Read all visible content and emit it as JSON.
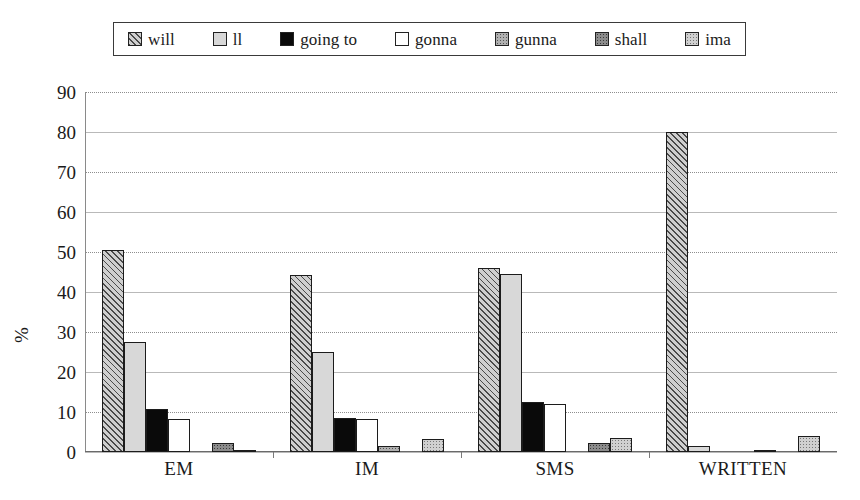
{
  "chart_data": {
    "type": "bar",
    "title": "",
    "subtitle": "",
    "xlabel": "",
    "ylabel": "%",
    "ylim": [
      0,
      90
    ],
    "ytick_step": 10,
    "yticks": [
      90,
      80,
      70,
      60,
      50,
      40,
      30,
      20,
      10,
      0
    ],
    "grid": true,
    "grid_axis": "y",
    "legend_position": "top",
    "categories": [
      "EM",
      "IM",
      "SMS",
      "WRITTEN"
    ],
    "series": [
      {
        "name": "will",
        "values": [
          50.5,
          44.2,
          46.1,
          80.0
        ]
      },
      {
        "name": "ll",
        "values": [
          27.6,
          24.9,
          44.4,
          1.5
        ]
      },
      {
        "name": "going to",
        "values": [
          10.8,
          8.5,
          12.6,
          0.0
        ]
      },
      {
        "name": "gonna",
        "values": [
          8.3,
          8.2,
          12.0,
          0.0
        ]
      },
      {
        "name": "gunna",
        "values": [
          0.0,
          1.5,
          0.0,
          0.4
        ]
      },
      {
        "name": "shall",
        "values": [
          2.2,
          0.0,
          2.3,
          0.0
        ]
      },
      {
        "name": "ima",
        "values": [
          0.6,
          3.3,
          3.4,
          4.0
        ]
      }
    ]
  },
  "legend": {
    "items": [
      {
        "label": "will",
        "swatch": "hatch-diagonal",
        "color": "#cfcfcf"
      },
      {
        "label": "ll",
        "swatch": "solid-lightgray",
        "color": "#d8d8d8"
      },
      {
        "label": "going to",
        "swatch": "solid-black",
        "color": "#0a0a0a"
      },
      {
        "label": "gonna",
        "swatch": "solid-white",
        "color": "#ffffff"
      },
      {
        "label": "gunna",
        "swatch": "dots-medium",
        "color": "#b0b0b0"
      },
      {
        "label": "shall",
        "swatch": "dots-dark",
        "color": "#8c8c8c"
      },
      {
        "label": "ima",
        "swatch": "dots-light",
        "color": "#d0d0d0"
      }
    ]
  },
  "axes": {
    "y_title": "%",
    "y_tick_labels": [
      "90",
      "80",
      "70",
      "60",
      "50",
      "40",
      "30",
      "20",
      "10",
      "0"
    ],
    "x_tick_labels": [
      "EM",
      "IM",
      "SMS",
      "WRITTEN"
    ]
  },
  "style": {
    "background": "#ffffff",
    "text_color": "#1a1a1a",
    "gridline_color": "#8e8e8e",
    "axis_color": "#6a6a6a",
    "bar_outline": "#1c1c1c"
  }
}
